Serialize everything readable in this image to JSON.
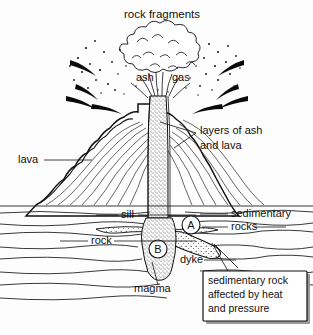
{
  "diagram": {
    "background_color": "#fdfdfd",
    "ink_color": "#111111"
  },
  "labels": {
    "rock_fragments": "rock fragments",
    "ash": "ash",
    "gas": "gas",
    "layers_of_ash_and_lava_line1": "layers of ash",
    "layers_of_ash_and_lava_line2": "and lava",
    "lava": "lava",
    "sill": "sill",
    "rock": "rock",
    "sedimentary_rocks_line1": "sedimentary",
    "sedimentary_rocks_line2": "rocks",
    "dyke": "dyke",
    "magma": "magma",
    "marker_a": "A",
    "marker_b": "B"
  },
  "callout": {
    "line1": "sedimentary rock",
    "line2": "affected by heat",
    "line3": "and pressure"
  }
}
